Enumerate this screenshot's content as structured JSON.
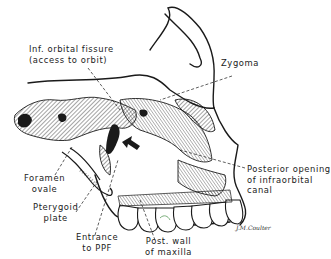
{
  "figure": {
    "labels": {
      "inf_orbital_fissure": {
        "line1": "Inf. orbital fissure",
        "line2": "(access to orbit)"
      },
      "zygoma": {
        "line1": "Zygoma"
      },
      "foramen_ovale": {
        "line1": "Foramen",
        "line2": "ovale"
      },
      "pterygoid_plate": {
        "line1": "Pterygoid",
        "line2": "plate"
      },
      "entrance_ppf": {
        "line1": "Entrance",
        "line2": "to PPF"
      },
      "post_wall_maxilla": {
        "line1": "Post. wall",
        "line2": "of maxilla"
      },
      "posterior_opening": {
        "line1": "Posterior opening",
        "line2": "of infraorbital",
        "line3": "canal"
      }
    },
    "signature": "J.M.Coulter",
    "colors": {
      "ink": "#1a1a1a",
      "background": "#ffffff",
      "accent_green": "#5a9a5a"
    }
  }
}
